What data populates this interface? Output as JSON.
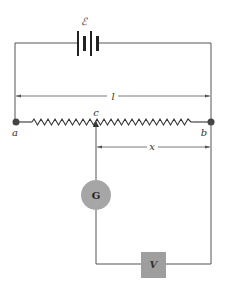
{
  "diagram": {
    "labels": {
      "emf": "ℰ",
      "length": "l",
      "point_a": "a",
      "point_b": "b",
      "slider": "c",
      "distance": "x",
      "galvanometer": "G",
      "unknown_source": "V"
    },
    "components": [
      {
        "id": "battery",
        "type": "battery",
        "label": "ℰ"
      },
      {
        "id": "resistor",
        "type": "slide-wire resistor",
        "from": "a",
        "to": "b"
      },
      {
        "id": "slider",
        "type": "sliding contact",
        "label": "c"
      },
      {
        "id": "galvanometer",
        "type": "galvanometer",
        "label": "G"
      },
      {
        "id": "source",
        "type": "unknown emf",
        "label": "V"
      }
    ],
    "dimensions": [
      {
        "label": "l",
        "from": "a",
        "to": "b"
      },
      {
        "label": "x",
        "from": "c",
        "to": "b"
      }
    ],
    "colors": {
      "wire": "#555555",
      "node": "#444444",
      "galvanometer_fill": "#a6a6a6",
      "source_fill": "#9e9e9e",
      "background": "#ffffff"
    }
  }
}
